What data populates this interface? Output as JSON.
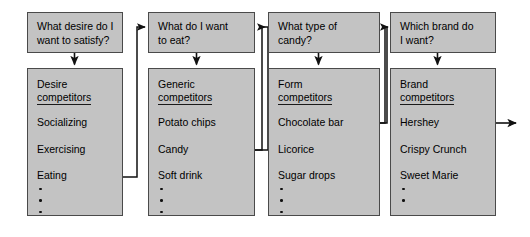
{
  "diagram": {
    "type": "flowchart",
    "background_color": "#ffffff",
    "box_fill_color": "#c3c3c3",
    "box_border_color": "#4a4a4a",
    "text_color": "#000000",
    "columns": [
      {
        "question": "What desire do I\nwant to satisfy?",
        "header": "Desire\ncompetitors",
        "items": [
          "Socializing",
          "Exercising",
          "Eating"
        ],
        "bullet_count": 3
      },
      {
        "question": "What do I want\nto eat?",
        "header": "Generic\ncompetitors",
        "items": [
          "Potato chips",
          "Candy",
          "Soft drink"
        ],
        "bullet_count": 3
      },
      {
        "question": "What type of\ncandy?",
        "header": "Form\ncompetitors",
        "items": [
          "Chocolate bar",
          "Licorice",
          "Sugar drops"
        ],
        "bullet_count": 3
      },
      {
        "question": "Which brand do\nI want?",
        "header": "Brand\ncompetitors",
        "items": [
          "Hershey",
          "Crispy Crunch",
          "Sweet Marie"
        ],
        "bullet_count": 2
      }
    ]
  }
}
